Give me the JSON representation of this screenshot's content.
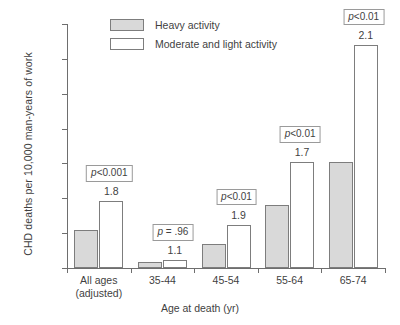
{
  "chart_data": {
    "type": "bar",
    "title": "",
    "xlabel": "Age at death (yr)",
    "ylabel": "CHD deaths per 10,000 man-years of work",
    "ylim": [
      0,
      175
    ],
    "yticks": [
      0,
      25,
      50,
      75,
      100,
      125,
      150,
      175
    ],
    "ytick_labels": [
      "0",
      "25",
      "50",
      "75",
      "100",
      "125",
      "150",
      "175"
    ],
    "grid": false,
    "legend_position": "top-center",
    "categories": [
      "All ages (adjusted)",
      "35-44",
      "45-54",
      "55-64",
      "65-74"
    ],
    "category_lines": [
      [
        "All ages",
        "(adjusted)"
      ],
      [
        "35-44"
      ],
      [
        "45-54"
      ],
      [
        "55-64"
      ],
      [
        "65-74"
      ]
    ],
    "series": [
      {
        "name": "Heavy activity",
        "color": "#d9d9d9",
        "values": [
          27,
          4,
          17,
          45,
          76
        ]
      },
      {
        "name": "Moderate and light activity",
        "color": "#ffffff",
        "values": [
          48,
          5.5,
          31,
          76,
          160
        ]
      }
    ],
    "annotations": {
      "ratios": [
        "1.8",
        "1.1",
        "1.9",
        "1.7",
        "2.1"
      ],
      "p_values": [
        "p<0.001",
        "p = .96",
        "p<0.01",
        "p<0.01",
        "p<0.01"
      ],
      "p_value_parts": [
        {
          "italic": "p",
          "rest": "<0.001"
        },
        {
          "italic": "p",
          "rest": " = .96"
        },
        {
          "italic": "p",
          "rest": "<0.01"
        },
        {
          "italic": "p",
          "rest": "<0.01"
        },
        {
          "italic": "p",
          "rest": "<0.01"
        }
      ]
    }
  },
  "legend": {
    "items": [
      {
        "label": "Heavy activity"
      },
      {
        "label": "Moderate and light activity"
      }
    ]
  },
  "colors": {
    "heavy_fill": "#d9d9d9",
    "light_fill": "#ffffff",
    "bar_stroke": "#7d7d7d",
    "axis": "#6e6e6e",
    "text": "#3f3f3f"
  }
}
